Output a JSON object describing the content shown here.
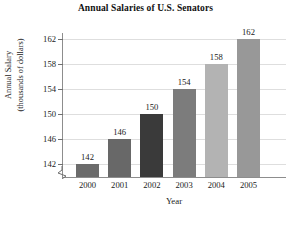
{
  "chart_data": {
    "type": "bar",
    "title": "Annual Salaries of U.S. Senators",
    "xlabel": "Year",
    "ylabel_line1": "Annual Salary",
    "ylabel_line2": "(thousands of dollars)",
    "categories": [
      "2000",
      "2001",
      "2002",
      "2003",
      "2004",
      "2005"
    ],
    "values": [
      142,
      146,
      150,
      154,
      158,
      162
    ],
    "value_labels": [
      "142",
      "146",
      "150",
      "154",
      "158",
      "162"
    ],
    "bar_colors": [
      "#6b6b6b",
      "#686868",
      "#3a3a3a",
      "#7c7c7c",
      "#b3b3b3",
      "#989898"
    ],
    "yticks": [
      142,
      146,
      150,
      154,
      158,
      162
    ],
    "ytick_labels": [
      "142",
      "146",
      "150",
      "154",
      "158",
      "162"
    ],
    "ylim": [
      140,
      163
    ],
    "grid": true,
    "legend": null,
    "axis_break": true,
    "axis_color": "#8d8d8d",
    "gridline_color": "#dedede"
  }
}
